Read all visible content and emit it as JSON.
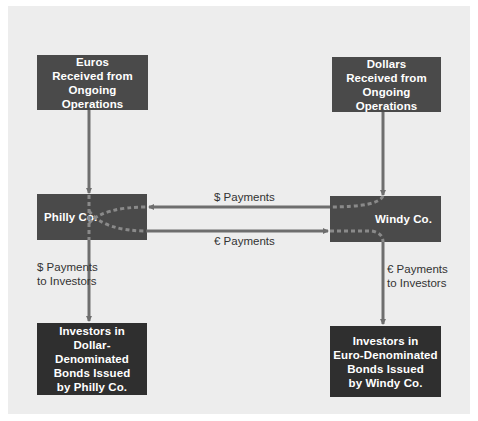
{
  "diagram": {
    "colors": {
      "panel_background": "#ededed",
      "box_fill": "#4a4a4a",
      "box_fill_dark": "#2f2f2f",
      "box_text": "#ffffff",
      "connector": "#6e6e6e",
      "dashed_path": "#8a8a8a",
      "label_text": "#333333"
    },
    "nodes": {
      "euros_source": {
        "label": "Euros\nReceived from\nOngoing Operations"
      },
      "dollars_source": {
        "label": "Dollars\nReceived from\nOngoing Operations"
      },
      "philly": {
        "label": "Philly Co."
      },
      "windy": {
        "label": "Windy Co."
      },
      "dollar_investors": {
        "label": "Investors in\nDollar-Denominated\nBonds Issued\nby Philly Co."
      },
      "euro_investors": {
        "label": "Investors in\nEuro-Denominated\nBonds Issued\nby Windy Co."
      }
    },
    "edges": {
      "dollar_payments": {
        "label": "$ Payments",
        "from": "Windy Co.",
        "to": "Philly Co."
      },
      "euro_payments": {
        "label": "€ Payments",
        "from": "Philly Co.",
        "to": "Windy Co."
      },
      "dollar_to_investors": {
        "label": "$ Payments\nto Investors",
        "from": "Philly Co.",
        "to": "Investors in Dollar-Denominated Bonds"
      },
      "euro_to_investors": {
        "label": "€ Payments\nto Investors",
        "from": "Windy Co.",
        "to": "Investors in Euro-Denominated Bonds"
      }
    }
  }
}
